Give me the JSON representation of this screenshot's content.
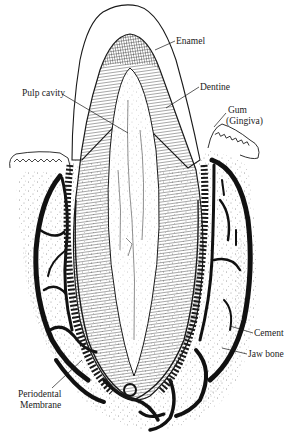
{
  "figure": {
    "labels": [
      {
        "id": "enamel",
        "text": "Enamel",
        "x": 176,
        "y": 44
      },
      {
        "id": "dentine",
        "text": "Dentine",
        "x": 200,
        "y": 90
      },
      {
        "id": "pulp",
        "text": "Pulp cavity",
        "x": 22,
        "y": 96
      },
      {
        "id": "gum",
        "text": "Gum",
        "x": 228,
        "y": 113
      },
      {
        "id": "gingiva",
        "text": "(Gingiva)",
        "x": 226,
        "y": 124
      },
      {
        "id": "cement",
        "text": "Cement",
        "x": 254,
        "y": 336
      },
      {
        "id": "jawbone",
        "text": "Jaw bone",
        "x": 248,
        "y": 357
      },
      {
        "id": "perio1",
        "text": "Periodental",
        "x": 18,
        "y": 397
      },
      {
        "id": "perio2",
        "text": "Membrane",
        "x": 20,
        "y": 408
      }
    ],
    "colors": {
      "ink": "#1a1a1a",
      "paper": "#ffffff"
    }
  }
}
